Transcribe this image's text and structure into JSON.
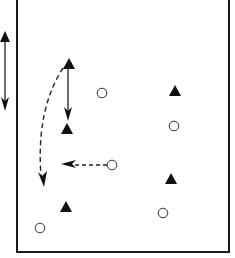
{
  "diagram": {
    "title": "",
    "colors": {
      "background": "#ffffff",
      "stroke": "#1a1a1a",
      "fill": "#111111"
    },
    "field": {
      "left": 17,
      "right": 229,
      "top": -2,
      "bottom": 252,
      "top_open": true
    },
    "players_triangle": [
      {
        "id": "t1",
        "x": 69,
        "y": 64
      },
      {
        "id": "t2",
        "x": 67,
        "y": 129
      },
      {
        "id": "t3",
        "x": 175,
        "y": 91
      },
      {
        "id": "t4",
        "x": 171,
        "y": 179
      },
      {
        "id": "t5",
        "x": 66,
        "y": 207
      }
    ],
    "players_circle": [
      {
        "id": "c1",
        "x": 102,
        "y": 93
      },
      {
        "id": "c2",
        "x": 174,
        "y": 126
      },
      {
        "id": "c3",
        "x": 112,
        "y": 165
      },
      {
        "id": "c4",
        "x": 163,
        "y": 213
      },
      {
        "id": "c5",
        "x": 40,
        "y": 228
      }
    ],
    "arrows": [
      {
        "id": "outside-double-arrow",
        "style": "solid",
        "heads": "both",
        "from": [
          5,
          31
        ],
        "to": [
          5,
          110
        ]
      },
      {
        "id": "shuttle-double-arrow",
        "style": "solid",
        "heads": "both",
        "from": [
          68,
          68
        ],
        "to": [
          68,
          120
        ]
      },
      {
        "id": "curved-run-arrow",
        "style": "dashed",
        "heads": "end",
        "from": [
          63,
          68
        ],
        "to": [
          44,
          186
        ]
      },
      {
        "id": "pass-arrow",
        "style": "dashed",
        "heads": "end",
        "from": [
          107,
          165
        ],
        "to": [
          62,
          164
        ]
      }
    ]
  }
}
